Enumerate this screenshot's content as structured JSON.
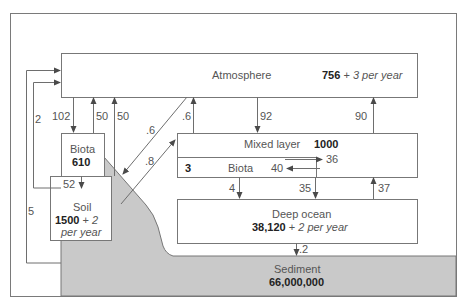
{
  "diagram": {
    "reservoirs": {
      "atmosphere": {
        "name": "Atmosphere",
        "value": "756",
        "plus": " + ",
        "growth": "3 per year"
      },
      "land_biota": {
        "name": "Biota",
        "value": "610"
      },
      "soil": {
        "name": "Soil",
        "value": "1500",
        "plus": " + ",
        "growth_line1": "2",
        "growth_line2": "per year"
      },
      "mixed_layer": {
        "name": "Mixed layer",
        "value": "1000"
      },
      "ocean_biota": {
        "name": "Biota",
        "value": "3"
      },
      "deep_ocean": {
        "name": "Deep ocean",
        "value": "38,120",
        "plus": " + ",
        "growth": "2 per year"
      },
      "sediment": {
        "name": "Sediment",
        "value": "66,000,000"
      }
    },
    "fluxes": {
      "atm_to_biota": "102",
      "biota_to_atm": "50",
      "soil_to_atm": "50",
      "biota_loop_to_atm": "2",
      "sediment_loop_to_atm": "5",
      "biota_to_soil": "52",
      "atm_to_land_diag": ".6",
      "land_to_mixed_diag": ".8",
      "mixed_to_atm_small": ".6",
      "atm_to_mixed": "92",
      "mixed_to_atm": "90",
      "mixed_to_biota": "40",
      "biota_to_mixed": "36",
      "biota_to_deep": "4",
      "mixed_to_deep": "35",
      "deep_to_mixed": "37",
      "deep_to_sediment": ".2"
    },
    "colors": {
      "line": "#6e6e6e",
      "sediment_fill": "#c8c8c8",
      "box_fill": "#ffffff"
    }
  }
}
